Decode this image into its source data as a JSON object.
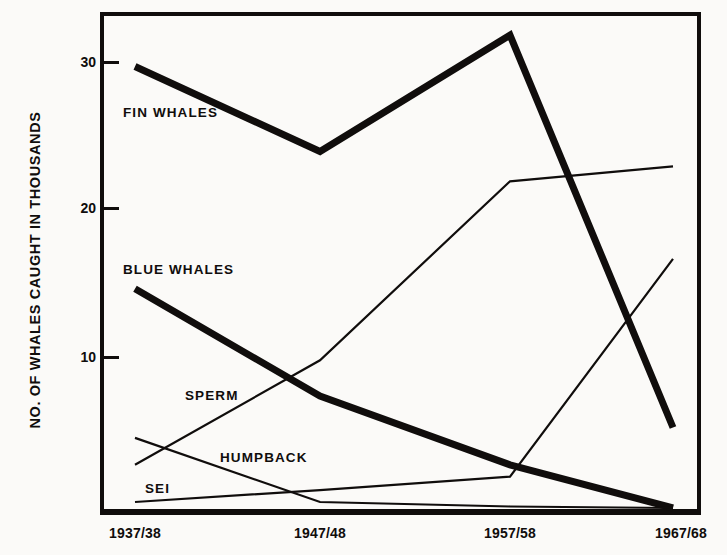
{
  "chart_data": {
    "type": "line",
    "title": "",
    "subtitle": "",
    "xlabel": "",
    "ylabel": "NO. OF WHALES CAUGHT IN THOUSANDS",
    "categories": [
      "1937/38",
      "1947/48",
      "1957/58",
      "1967/68"
    ],
    "x": [
      1937,
      1947,
      1957,
      1967
    ],
    "xtick_labels": [
      "1937/38",
      "1947/48",
      "1957/58",
      "1967/68"
    ],
    "ytick_labels": [
      "10",
      "20",
      "30"
    ],
    "yticks": [
      10,
      20,
      30
    ],
    "ylim": [
      0,
      33.5
    ],
    "xlim": [
      1936,
      1968.5
    ],
    "grid": false,
    "legend": "inline-annotations",
    "units": "thousands of whales caught",
    "series": [
      {
        "name": "FIN WHALES",
        "values": [
          29.7,
          24.0,
          31.8,
          5.5
        ],
        "line_weight": "thick",
        "color": "#100d0c",
        "label_position": {
          "x": 123,
          "y": 105
        }
      },
      {
        "name": "BLUE WHALES",
        "values": [
          14.8,
          7.6,
          3.0,
          0.1
        ],
        "line_weight": "thick",
        "color": "#100d0c",
        "label_position": {
          "x": 123,
          "y": 262
        }
      },
      {
        "name": "SPERM",
        "values": [
          3.0,
          10.0,
          22.0,
          23.0
        ],
        "line_weight": "thin",
        "color": "#100d0c",
        "label_position": {
          "x": 185,
          "y": 388
        }
      },
      {
        "name": "HUMPBACK",
        "values": [
          4.8,
          0.5,
          0.2,
          0.1
        ],
        "line_weight": "thin",
        "color": "#100d0c",
        "label_position": {
          "x": 220,
          "y": 450
        }
      },
      {
        "name": "SEI",
        "values": [
          0.5,
          1.3,
          2.2,
          16.8
        ],
        "line_weight": "thin",
        "color": "#100d0c",
        "label_position": {
          "x": 145,
          "y": 481
        }
      }
    ],
    "colors": {
      "ink": "#100d0c",
      "background": "#fbfaf8"
    }
  },
  "axis": {
    "frame_color": "#100d0c",
    "y_title": "NO. OF WHALES CAUGHT IN THOUSANDS"
  }
}
